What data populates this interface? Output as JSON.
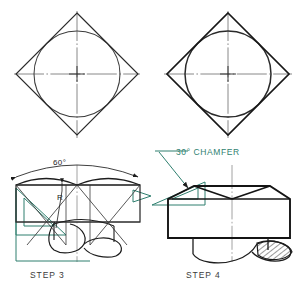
{
  "page": {
    "background_color": "#ffffff",
    "ink_color": "#1d1d1d",
    "thin_ink_color": "#4a4a4a",
    "tool_color": "#2f7f6f",
    "label_color": "#3b3b3b"
  },
  "panels": [
    {
      "id": "panel-top-left",
      "step_label": "",
      "caption": "",
      "figure": "square-rotated-45-with-inscribed-circle-and-centerlines"
    },
    {
      "id": "panel-top-right",
      "step_label": "",
      "caption": "",
      "figure": "square-rotated-45-with-inscribed-circle-and-centerlines-bold"
    },
    {
      "id": "panel-bottom-left",
      "step_label": "STEP 3",
      "caption": "STEP 3",
      "figure": "hex-nut-front-view-chamfer-arcs-construction"
    },
    {
      "id": "panel-bottom-right",
      "step_label": "STEP 4",
      "caption": "STEP 4",
      "figure": "hex-nut-front-view-finished-with-thread-section"
    }
  ],
  "annotations": {
    "angle_dimension": "60°",
    "radius_leader": "R",
    "chamfer_note": "30° CHAMFER"
  },
  "tools": {
    "set_square_step3": "30-60-90 set square",
    "set_square_step4": "30-60-90 set square",
    "arrow_step3": "direction arrow"
  },
  "icons": {
    "center_mark": "center-mark-icon",
    "arrowhead": "arrowhead-icon",
    "hatch": "section-hatch-icon"
  }
}
